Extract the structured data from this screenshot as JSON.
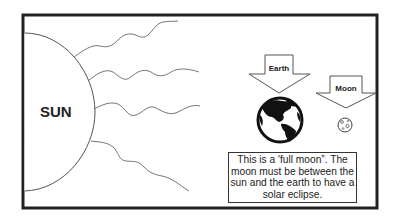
{
  "diagram": {
    "type": "solar-eclipse-explanation",
    "sun": {
      "label": "SUN"
    },
    "earth": {
      "label": "Earth"
    },
    "moon": {
      "label": "Moon"
    },
    "caption": {
      "lines": [
        "This is a 'full moon”.  The",
        "moon must be between the",
        "sun and the earth to have a",
        "solar eclipse."
      ]
    },
    "colors": {
      "frame": "#222222",
      "lines": "#555555",
      "globe": "#111111",
      "background": "#ffffff"
    }
  }
}
